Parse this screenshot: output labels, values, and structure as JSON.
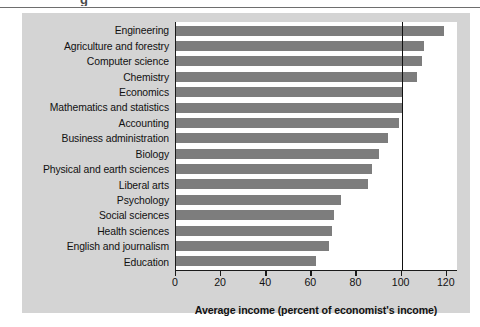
{
  "figure": {
    "panel_background": "#d4d4d4",
    "plot_background": "#ffffff",
    "bar_color": "#7d7d7d",
    "axis_color": "#111111",
    "caption_fragment": "g"
  },
  "chart_data": {
    "type": "bar",
    "orientation": "horizontal",
    "title": "",
    "xlabel": "Average income (percent of economist's income)",
    "ylabel": "",
    "xlim": [
      0,
      125
    ],
    "xticks": [
      0,
      20,
      40,
      60,
      80,
      100,
      120
    ],
    "xtick_labels": [
      "0",
      "20",
      "40",
      "60",
      "80",
      "100",
      "120"
    ],
    "grid": false,
    "reference_line": 100,
    "legend": null,
    "categories": [
      "Engineering",
      "Agriculture and forestry",
      "Computer science",
      "Chemistry",
      "Economics",
      "Mathematics and statistics",
      "Accounting",
      "Business administration",
      "Biology",
      "Physical and earth sciences",
      "Liberal arts",
      "Psychology",
      "Social sciences",
      "Health sciences",
      "English and journalism",
      "Education"
    ],
    "values": [
      119,
      110,
      109,
      107,
      100,
      100,
      99,
      94,
      90,
      87,
      85,
      73,
      70,
      69,
      68,
      62
    ]
  }
}
